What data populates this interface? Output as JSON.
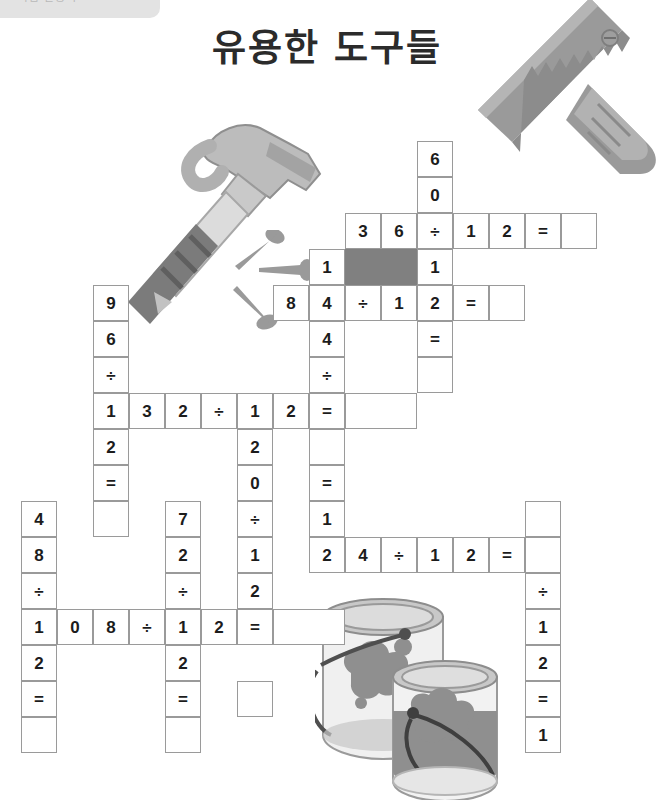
{
  "page": {
    "title": "유용한 도구들",
    "top_tab_label": "학습 활동지",
    "background_color": "#ffffff",
    "grid_line_color": "#9a9a9a",
    "blocked_cell_color": "#808080",
    "text_color": "#1c1c1c"
  },
  "illustrations": [
    {
      "name": "saw-illustration",
      "label": "saw"
    },
    {
      "name": "hammer-illustration",
      "label": "hammer"
    },
    {
      "name": "nails-illustration",
      "label": "nails"
    },
    {
      "name": "paint-cans-illustration",
      "label": "paint cans"
    }
  ],
  "grid": {
    "cell_size": 36,
    "origin": {
      "x": 21,
      "y": 141
    },
    "columns": 18,
    "rows": 19,
    "cells": [
      {
        "col": 11,
        "row": 0,
        "value": "6"
      },
      {
        "col": 11,
        "row": 1,
        "value": "0"
      },
      {
        "col": 9,
        "row": 2,
        "value": "3"
      },
      {
        "col": 10,
        "row": 2,
        "value": "6"
      },
      {
        "col": 11,
        "row": 2,
        "value": "÷"
      },
      {
        "col": 12,
        "row": 2,
        "value": "1"
      },
      {
        "col": 13,
        "row": 2,
        "value": "2"
      },
      {
        "col": 14,
        "row": 2,
        "value": "="
      },
      {
        "col": 15,
        "row": 2,
        "value": ""
      },
      {
        "col": 8,
        "row": 3,
        "value": "1"
      },
      {
        "col": 9,
        "row": 3,
        "value": "",
        "blocked": true,
        "span": 2
      },
      {
        "col": 11,
        "row": 3,
        "value": "1"
      },
      {
        "col": 7,
        "row": 4,
        "value": "8"
      },
      {
        "col": 8,
        "row": 4,
        "value": "4"
      },
      {
        "col": 9,
        "row": 4,
        "value": "÷"
      },
      {
        "col": 10,
        "row": 4,
        "value": "1"
      },
      {
        "col": 11,
        "row": 4,
        "value": "2"
      },
      {
        "col": 12,
        "row": 4,
        "value": "="
      },
      {
        "col": 13,
        "row": 4,
        "value": ""
      },
      {
        "col": 2,
        "row": 4,
        "value": "9"
      },
      {
        "col": 8,
        "row": 5,
        "value": "4"
      },
      {
        "col": 11,
        "row": 5,
        "value": "="
      },
      {
        "col": 2,
        "row": 5,
        "value": "6"
      },
      {
        "col": 8,
        "row": 6,
        "value": "÷"
      },
      {
        "col": 11,
        "row": 6,
        "value": ""
      },
      {
        "col": 2,
        "row": 6,
        "value": "÷"
      },
      {
        "col": 2,
        "row": 7,
        "value": "1"
      },
      {
        "col": 3,
        "row": 7,
        "value": "3"
      },
      {
        "col": 4,
        "row": 7,
        "value": "2"
      },
      {
        "col": 5,
        "row": 7,
        "value": "÷"
      },
      {
        "col": 6,
        "row": 7,
        "value": "1"
      },
      {
        "col": 7,
        "row": 7,
        "value": "2"
      },
      {
        "col": 8,
        "row": 7,
        "value": "="
      },
      {
        "col": 9,
        "row": 7,
        "value": "",
        "span": 2
      },
      {
        "col": 2,
        "row": 8,
        "value": "2"
      },
      {
        "col": 6,
        "row": 8,
        "value": "2"
      },
      {
        "col": 8,
        "row": 8,
        "value": ""
      },
      {
        "col": 2,
        "row": 9,
        "value": "="
      },
      {
        "col": 6,
        "row": 9,
        "value": "0"
      },
      {
        "col": 8,
        "row": 9,
        "value": "="
      },
      {
        "col": 0,
        "row": 10,
        "value": "4"
      },
      {
        "col": 2,
        "row": 10,
        "value": ""
      },
      {
        "col": 4,
        "row": 10,
        "value": "7"
      },
      {
        "col": 6,
        "row": 10,
        "value": "÷"
      },
      {
        "col": 8,
        "row": 10,
        "value": "1"
      },
      {
        "col": 14,
        "row": 10,
        "value": ""
      },
      {
        "col": 0,
        "row": 11,
        "value": "8"
      },
      {
        "col": 4,
        "row": 11,
        "value": "2"
      },
      {
        "col": 6,
        "row": 11,
        "value": "1"
      },
      {
        "col": 8,
        "row": 11,
        "value": "2"
      },
      {
        "col": 9,
        "row": 11,
        "value": "4"
      },
      {
        "col": 10,
        "row": 11,
        "value": "÷"
      },
      {
        "col": 11,
        "row": 11,
        "value": "1"
      },
      {
        "col": 12,
        "row": 11,
        "value": "2"
      },
      {
        "col": 13,
        "row": 11,
        "value": "="
      },
      {
        "col": 14,
        "row": 11,
        "value": ""
      },
      {
        "col": 0,
        "row": 12,
        "value": "÷"
      },
      {
        "col": 4,
        "row": 12,
        "value": "÷"
      },
      {
        "col": 6,
        "row": 12,
        "value": "2"
      },
      {
        "col": 14,
        "row": 12,
        "value": "÷"
      },
      {
        "col": 0,
        "row": 13,
        "value": "1"
      },
      {
        "col": 1,
        "row": 13,
        "value": "0"
      },
      {
        "col": 2,
        "row": 13,
        "value": "8"
      },
      {
        "col": 3,
        "row": 13,
        "value": "÷"
      },
      {
        "col": 4,
        "row": 13,
        "value": "1"
      },
      {
        "col": 5,
        "row": 13,
        "value": "2"
      },
      {
        "col": 6,
        "row": 13,
        "value": "="
      },
      {
        "col": 7,
        "row": 13,
        "value": "",
        "span": 2
      },
      {
        "col": 14,
        "row": 13,
        "value": "1"
      },
      {
        "col": 0,
        "row": 14,
        "value": "2"
      },
      {
        "col": 4,
        "row": 14,
        "value": "2"
      },
      {
        "col": 14,
        "row": 14,
        "value": "2"
      },
      {
        "col": 0,
        "row": 15,
        "value": "="
      },
      {
        "col": 4,
        "row": 15,
        "value": "="
      },
      {
        "col": 6,
        "row": 15,
        "value": ""
      },
      {
        "col": 14,
        "row": 15,
        "value": "="
      },
      {
        "col": 0,
        "row": 16,
        "value": ""
      },
      {
        "col": 4,
        "row": 16,
        "value": ""
      },
      {
        "col": 14,
        "row": 16,
        "value": "1"
      }
    ]
  }
}
